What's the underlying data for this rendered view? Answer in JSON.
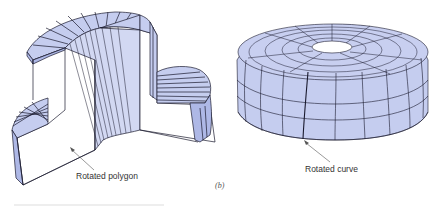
{
  "figure": {
    "subfigure_label": "(b)",
    "left_solid": {
      "label": "Rotated polygon",
      "shape": "stepped-cylinder-sweep"
    },
    "right_solid": {
      "label": "Rotated curve",
      "shape": "dome-with-hole-sweep"
    }
  },
  "colors": {
    "face_fill": "#c5cdef",
    "face_fill_dark": "#aeb8e6",
    "cut_face": "#ffffff",
    "edge": "#1a1a2e",
    "label_text": "#333333"
  }
}
